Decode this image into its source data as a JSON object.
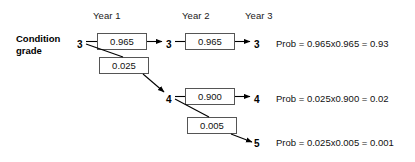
{
  "diagram": {
    "title_row": {
      "years": [
        {
          "label": "Year 1"
        },
        {
          "label": "Year 2"
        },
        {
          "label": "Year 3"
        }
      ]
    },
    "caption": {
      "line1": "Condition",
      "line2": "grade"
    },
    "nodes": {
      "start_grade": "3",
      "year2_top_grade": "3",
      "year3_top_grade": "3",
      "year2_mid_grade": "4",
      "year3_mid_grade": "4",
      "year3_bottom_grade": "5"
    },
    "transition_boxes": [
      {
        "id": "y1-stay",
        "value": "0.965"
      },
      {
        "id": "y2-stay",
        "value": "0.965"
      },
      {
        "id": "y1-drop",
        "value": "0.025"
      },
      {
        "id": "y2-stay-4",
        "value": "0.900"
      },
      {
        "id": "y2-drop-5",
        "value": "0.005"
      }
    ],
    "probabilities": [
      {
        "id": "path-333",
        "text": "Prob = 0.965x0.965 = 0.93"
      },
      {
        "id": "path-344",
        "text": "Prob = 0.025x0.900 = 0.02"
      },
      {
        "id": "path-345",
        "text": "Prob = 0.025x0.005 = 0.001"
      }
    ]
  }
}
